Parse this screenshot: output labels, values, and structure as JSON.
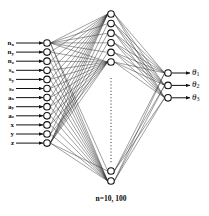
{
  "figure": {
    "type": "neural-network-diagram",
    "caption": "n=10, 100",
    "background_color": "#ffffff",
    "stroke_color": "#111111"
  },
  "layers": {
    "input": {
      "name": "input-layer",
      "count": 12,
      "x": 47,
      "y_start": 43,
      "y_step": 9.1,
      "radius": 3.3,
      "nodes": [
        {
          "base": "n",
          "sub": "x"
        },
        {
          "base": "n",
          "sub": "y"
        },
        {
          "base": "n",
          "sub": "z"
        },
        {
          "base": "s",
          "sub": "x"
        },
        {
          "base": "s",
          "sub": "y"
        },
        {
          "base": "s",
          "sub": "z"
        },
        {
          "base": "a",
          "sub": "x"
        },
        {
          "base": "a",
          "sub": "y"
        },
        {
          "base": "a",
          "sub": "z"
        },
        {
          "base": "x",
          "sub": ""
        },
        {
          "base": "y",
          "sub": ""
        },
        {
          "base": "z",
          "sub": ""
        }
      ]
    },
    "hidden": {
      "name": "hidden-layer",
      "x": 111,
      "top_count": 6,
      "top_y_start": 14,
      "top_y_step": 9.6,
      "bottom_count": 2,
      "bottom_y": [
        171,
        181
      ],
      "radius": 3.3,
      "ellipsis": {
        "y_start": 78,
        "y_end": 163
      }
    },
    "output": {
      "name": "output-layer",
      "count": 3,
      "x": 168,
      "y_start": 73,
      "y_step": 12.4,
      "radius": 3.3,
      "nodes": [
        {
          "base": "θ",
          "sub": "1"
        },
        {
          "base": "θ",
          "sub": "2"
        },
        {
          "base": "θ",
          "sub": "3"
        }
      ]
    }
  },
  "arrows": {
    "input_arrow_start_x": 16,
    "input_arrow_end_x": 43,
    "output_arrow_start_x": 172,
    "output_arrow_end_x": 190,
    "label_x_input": 14,
    "label_x_output": 192
  }
}
